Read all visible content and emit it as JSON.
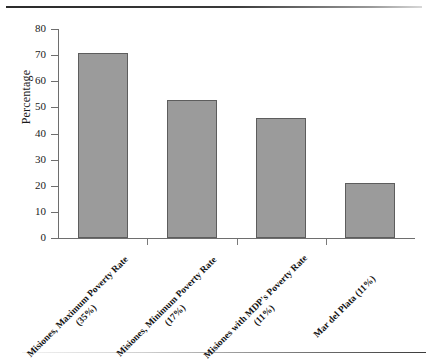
{
  "chart_data": {
    "type": "bar",
    "title": "",
    "subtitle": "",
    "xlabel": "",
    "ylabel": "Percentage",
    "ylim": [
      0,
      80
    ],
    "yticks": [
      0,
      10,
      20,
      30,
      40,
      50,
      60,
      70,
      80
    ],
    "grid": false,
    "legend": null,
    "categories": [
      "Misiones, Maximum Poverty Rate (35%)",
      "Misiones, Minimum Poverty Rate (17%)",
      "Misiones with MDP's Poverty Rate (11%)",
      "Mar del Plata (11%)"
    ],
    "values": [
      71,
      53,
      46,
      21
    ],
    "bar_color": "#9b9b9b",
    "bar_edge_color": "#5d5d5d",
    "axis_color": "#6e6e6e"
  },
  "figure": {
    "background": "#ffffff"
  }
}
